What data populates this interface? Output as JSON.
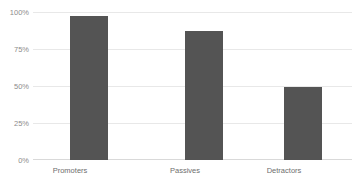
{
  "chart_data": {
    "type": "bar",
    "title": "",
    "xlabel": "",
    "ylabel": "",
    "categories": [
      "Promoters",
      "Passives",
      "Detractors"
    ],
    "values": [
      97,
      87,
      49
    ],
    "value_labels": [
      "97%",
      "87%",
      "49%"
    ],
    "ylim": [
      0,
      100
    ],
    "ytick_labels": [
      "100%",
      "75%",
      "50%",
      "25%",
      "0%"
    ],
    "ytick_values": [
      100,
      75,
      50,
      25,
      0
    ],
    "grid": true,
    "grid_axis": "y",
    "legend": false,
    "legend_position": "none",
    "series": [
      {
        "name": "",
        "values": [
          97,
          87,
          49
        ]
      }
    ],
    "colors": {
      "bar": "#545454",
      "gridline": "#e8e8e8",
      "baseline": "#d9d9d9",
      "tick_label": "#8c8c8c",
      "category_label": "#6e6e6e",
      "background": "#ffffff"
    }
  }
}
